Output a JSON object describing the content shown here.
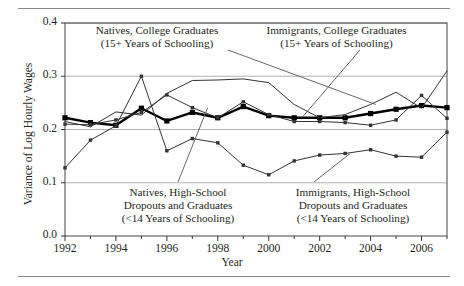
{
  "figure": {
    "has_top_rule": true,
    "has_bottom_rule": true,
    "background": "#ffffff",
    "frame_color": "#444444",
    "gridline_color": "#9a9a9a"
  },
  "axis": {
    "ylabel": "Variance of Log Hourly Wages",
    "xlabel": "Year",
    "y_ticks": [
      "0.0",
      "0.1",
      "0.2",
      "0.3",
      "0.4"
    ],
    "x_ticks": [
      "1992",
      "1994",
      "1996",
      "1998",
      "2000",
      "2002",
      "2004",
      "2006"
    ]
  },
  "annotations": {
    "natives_college": {
      "line1": "Natives, College Graduates",
      "line2": "(15+ Years of Schooling)"
    },
    "immigrants_college": {
      "line1": "Immigrants, College Graduates",
      "line2": "(15+ Years of Schooling)"
    },
    "natives_hs": {
      "line1": "Natives, High-School",
      "line2": "Dropouts and Graduates",
      "line3": "(<14 Years of Schooling)"
    },
    "immigrants_hs": {
      "line1": "Immigrants, High-School",
      "line2": "Dropouts and Graduates",
      "line3": "(<14 Years of Schooling)"
    }
  },
  "chart_data": {
    "type": "line",
    "title": "",
    "xlabel": "Year",
    "ylabel": "Variance of Log Hourly Wages",
    "xlim": [
      1992,
      2007
    ],
    "ylim": [
      0.0,
      0.4
    ],
    "ytick_values": [
      0.0,
      0.1,
      0.2,
      0.3,
      0.4
    ],
    "xtick_values": [
      1992,
      1994,
      1996,
      1998,
      2000,
      2002,
      2004,
      2006
    ],
    "grid": "horizontal",
    "legend": "inline-annotations",
    "x": [
      1992,
      1993,
      1994,
      1995,
      1996,
      1997,
      1998,
      1999,
      2000,
      2001,
      2002,
      2003,
      2004,
      2005,
      2006,
      2007
    ],
    "series": [
      {
        "name": "Natives, College Graduates (15+ Years of Schooling)",
        "style": "thick-black-square-markers",
        "color": "#000000",
        "line_width": 2.4,
        "marker": "square",
        "values": [
          0.222,
          0.213,
          0.208,
          0.24,
          0.216,
          0.232,
          0.222,
          0.243,
          0.226,
          0.222,
          0.222,
          0.222,
          0.23,
          0.238,
          0.245,
          0.241
        ]
      },
      {
        "name": "Immigrants, College Graduates (15+ Years of Schooling)",
        "style": "thin-black-no-markers",
        "color": "#333333",
        "line_width": 1.0,
        "marker": "none",
        "values": [
          0.215,
          0.205,
          0.233,
          0.227,
          0.268,
          0.292,
          0.293,
          0.295,
          0.288,
          0.247,
          0.222,
          0.228,
          0.247,
          0.27,
          0.24,
          0.31
        ]
      },
      {
        "name": "Natives, High-School Dropouts and Graduates (<14 Years of Schooling)",
        "style": "thin-black-small-square-markers",
        "color": "#333333",
        "line_width": 1.0,
        "marker": "small-square",
        "values": [
          0.21,
          0.209,
          0.218,
          0.232,
          0.265,
          0.241,
          0.222,
          0.252,
          0.228,
          0.215,
          0.215,
          0.213,
          0.208,
          0.218,
          0.264,
          0.221
        ]
      },
      {
        "name": "Immigrants, High-School Dropouts and Graduates (<14 Years of Schooling)",
        "style": "thin-black-small-diamond-markers",
        "color": "#333333",
        "line_width": 1.0,
        "marker": "small-square",
        "values": [
          0.128,
          0.18,
          0.207,
          0.3,
          0.16,
          0.183,
          0.175,
          0.133,
          0.115,
          0.141,
          0.152,
          0.155,
          0.162,
          0.15,
          0.148,
          0.195
        ]
      }
    ]
  }
}
